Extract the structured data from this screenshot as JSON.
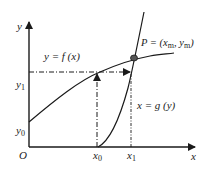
{
  "diagram": {
    "axes": {
      "x_label": "x",
      "y_label": "y",
      "origin_label": "O"
    },
    "x_ticks": [
      {
        "base": "x",
        "sub": "0"
      },
      {
        "base": "x",
        "sub": "1"
      }
    ],
    "y_ticks": [
      {
        "base": "y",
        "sub": "0"
      },
      {
        "base": "y",
        "sub": "1"
      }
    ],
    "curves": [
      {
        "id": "f",
        "label": "y = f (x)"
      },
      {
        "id": "g",
        "label": "x = g (y)"
      }
    ],
    "point": {
      "label_prefix": "P = (",
      "xm_base": "x",
      "xm_sub": "m",
      "sep": ", ",
      "ym_base": "y",
      "ym_sub": "m",
      "label_suffix": ")"
    },
    "colors": {
      "line": "#1a1a1a",
      "point_fill": "#555555"
    }
  }
}
